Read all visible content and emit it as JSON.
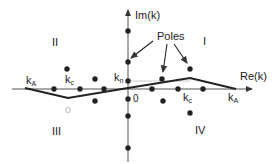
{
  "diagram": {
    "axes": {
      "x_label": "Re(k)",
      "y_label": "Im(k)",
      "origin_label": "0"
    },
    "quadrants": [
      "I",
      "II",
      "III",
      "IV"
    ],
    "annotation": "Poles",
    "labels": {
      "kA_left": "k",
      "kA_left_sub": "A",
      "kc_left": "k",
      "kc_left_sub": "c",
      "kn": "k",
      "kn_sub": "n",
      "kc_right": "k",
      "kc_right_sub": "c",
      "kA_right": "k",
      "kA_right_sub": "A"
    },
    "colors": {
      "ink": "#222222",
      "axis": "#555555",
      "guide": "#999999"
    }
  }
}
